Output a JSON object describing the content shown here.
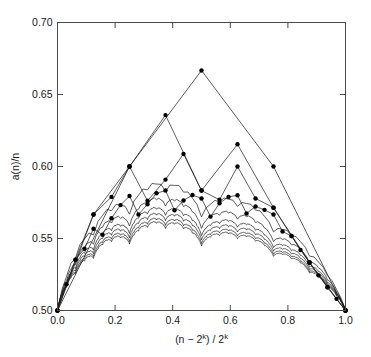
{
  "chart_data": {
    "type": "line",
    "title": "",
    "subtitle": "",
    "xlabel": "(n − 2k) / 2k",
    "xlabel_parts": {
      "pre": "(n − 2",
      "sup1": "k",
      "mid": ") / 2",
      "sup2": "k"
    },
    "ylabel": "a(n)/n",
    "xlim": [
      0.0,
      1.0
    ],
    "ylim": [
      0.5,
      0.7
    ],
    "xticks": [
      0.0,
      0.2,
      0.4,
      0.6,
      0.8,
      1.0
    ],
    "xticklabels": [
      "0.0",
      "0.2",
      "0.4",
      "0.6",
      "0.8",
      "1.0"
    ],
    "yticks": [
      0.5,
      0.55,
      0.6,
      0.65,
      0.7
    ],
    "yticklabels": [
      "0.50",
      "0.55",
      "0.60",
      "0.65",
      "0.70"
    ],
    "grid": false,
    "legend": "none",
    "axis_color": "#4a4a4a",
    "line_color": "#1a1a1a",
    "marker_color": "#000000",
    "marker_shape": "filled-circle",
    "marker_size_px": 2.2,
    "series": [
      {
        "name": "k=2",
        "markers": true,
        "x": [
          0.0,
          0.25,
          0.5,
          0.75,
          1.0
        ],
        "y": [
          0.5,
          0.6,
          0.6667,
          0.6,
          0.5
        ]
      },
      {
        "name": "k=3",
        "markers": true,
        "x": [
          0.0,
          0.125,
          0.25,
          0.375,
          0.5,
          0.625,
          0.75,
          0.875,
          1.0
        ],
        "y": [
          0.5,
          0.5667,
          0.6,
          0.6357,
          0.5833,
          0.6154,
          0.5714,
          0.5333,
          0.5
        ]
      },
      {
        "name": "k=4",
        "markers": true,
        "x": [
          0.0,
          0.0625,
          0.125,
          0.1875,
          0.25,
          0.3125,
          0.375,
          0.4375,
          0.5,
          0.5625,
          0.625,
          0.6875,
          0.75,
          0.8125,
          0.875,
          0.9375,
          1.0
        ],
        "y": [
          0.5,
          0.5353,
          0.5667,
          0.5789,
          0.6,
          0.5762,
          0.5909,
          0.6087,
          0.5833,
          0.5769,
          0.6,
          0.5778,
          0.5714,
          0.5517,
          0.5333,
          0.5161,
          0.5
        ]
      },
      {
        "name": "k=5",
        "markers": true,
        "x": [
          0.0,
          0.03125,
          0.0625,
          0.09375,
          0.125,
          0.15625,
          0.1875,
          0.21875,
          0.25,
          0.28125,
          0.3125,
          0.34375,
          0.375,
          0.40625,
          0.4375,
          0.46875,
          0.5,
          0.53125,
          0.5625,
          0.59375,
          0.625,
          0.65625,
          0.6875,
          0.71875,
          0.75,
          0.78125,
          0.8125,
          0.84375,
          0.875,
          0.90625,
          0.9375,
          0.96875,
          1.0
        ],
        "y": [
          0.5,
          0.5182,
          0.5353,
          0.5429,
          0.5568,
          0.5526,
          0.5641,
          0.5732,
          0.5795,
          0.5667,
          0.5738,
          0.5814,
          0.5833,
          0.5696,
          0.5764,
          0.5802,
          0.5778,
          0.5652,
          0.5745,
          0.5789,
          0.58,
          0.5674,
          0.5722,
          0.5699,
          0.5667,
          0.5549,
          0.5517,
          0.542,
          0.5333,
          0.5244,
          0.5161,
          0.5081,
          0.5
        ]
      },
      {
        "name": "k=6",
        "markers": false,
        "peak": 0.565,
        "endpoints": [
          0.5,
          0.5
        ]
      },
      {
        "name": "k=7",
        "markers": false,
        "peak": 0.557,
        "endpoints": [
          0.5,
          0.5
        ]
      },
      {
        "name": "k=8",
        "markers": false,
        "peak": 0.552,
        "endpoints": [
          0.5,
          0.5
        ]
      },
      {
        "name": "k=9",
        "markers": false,
        "peak": 0.549,
        "endpoints": [
          0.5,
          0.5
        ]
      },
      {
        "name": "k=10",
        "markers": false,
        "peak": 0.5465,
        "endpoints": [
          0.5,
          0.5
        ]
      },
      {
        "name": "k=11",
        "markers": false,
        "peak": 0.5448,
        "endpoints": [
          0.5,
          0.5
        ]
      }
    ]
  }
}
